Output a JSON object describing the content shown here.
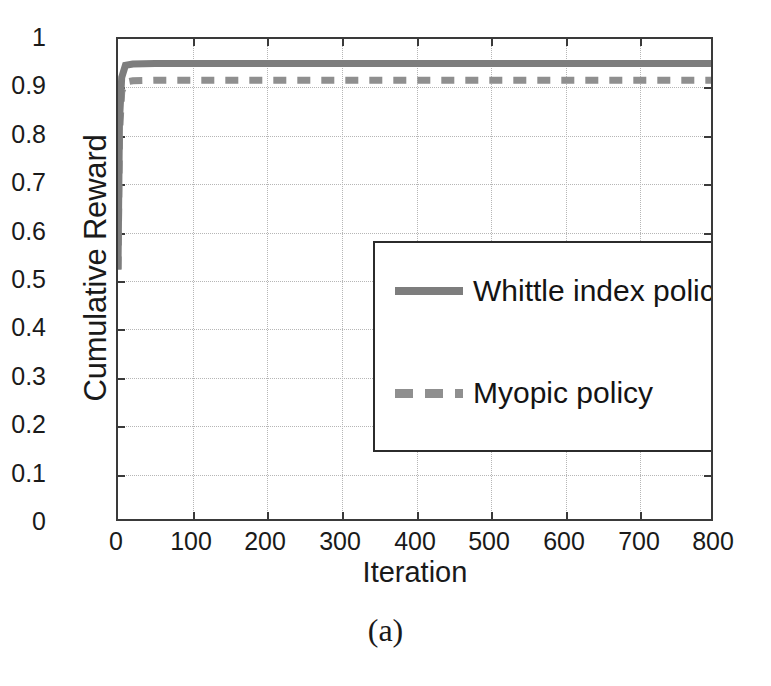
{
  "figure": {
    "caption": "(a)"
  },
  "chart_data": {
    "type": "line",
    "title": "",
    "subtitle": "",
    "xlabel": "Iteration",
    "ylabel": "Cumulative Reward",
    "xlim": [
      0,
      800
    ],
    "ylim": [
      0,
      1
    ],
    "xticks": [
      0,
      100,
      200,
      300,
      400,
      500,
      600,
      700,
      800
    ],
    "xtick_labels": [
      "0",
      "100",
      "200",
      "300",
      "400",
      "500",
      "600",
      "700",
      "800"
    ],
    "yticks": [
      0,
      0.1,
      0.2,
      0.3,
      0.4,
      0.5,
      0.6,
      0.7,
      0.8,
      0.9,
      1
    ],
    "ytick_labels": [
      "0",
      "0.1",
      "0.2",
      "0.3",
      "0.4",
      "0.5",
      "0.6",
      "0.7",
      "0.8",
      "0.9",
      "1"
    ],
    "grid": true,
    "grid_style": "dotted",
    "grid_color": "#b6b6b6",
    "legend_position": "center",
    "series": [
      {
        "name": "Whittle index policy",
        "style": "solid",
        "color": "#7d7d7d",
        "linewidth": 7,
        "x": [
          0,
          2,
          5,
          10,
          20,
          50,
          100,
          200,
          300,
          400,
          500,
          600,
          700,
          800
        ],
        "values": [
          0.52,
          0.83,
          0.92,
          0.945,
          0.948,
          0.949,
          0.949,
          0.949,
          0.949,
          0.949,
          0.949,
          0.949,
          0.949,
          0.949
        ]
      },
      {
        "name": "Myopic policy",
        "style": "dashed",
        "color": "#8f8f8f",
        "linewidth": 7,
        "x": [
          0,
          2,
          5,
          10,
          20,
          50,
          100,
          200,
          300,
          400,
          500,
          600,
          700,
          800
        ],
        "values": [
          0.52,
          0.8,
          0.89,
          0.91,
          0.913,
          0.914,
          0.914,
          0.914,
          0.914,
          0.914,
          0.914,
          0.914,
          0.914,
          0.914
        ]
      }
    ],
    "annotations": []
  },
  "legend": {
    "entries": [
      {
        "label": "Whittle index policy"
      },
      {
        "label": "Myopic policy"
      }
    ]
  }
}
